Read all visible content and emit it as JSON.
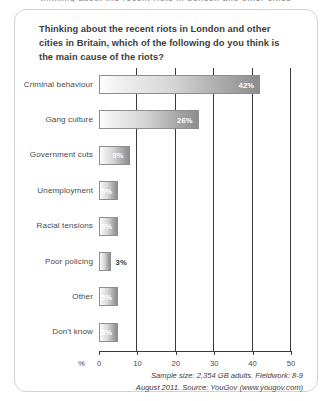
{
  "top_cropped_text": "thinking about the recent riots in London and other cities",
  "question": "Thinking about the recent riots in London and other cities in Britain, which of the following do you think is the main cause of the riots?",
  "axis": {
    "percent_sign": "%",
    "ticks": [
      "0",
      "10",
      "20",
      "30",
      "40",
      "50"
    ]
  },
  "footnote_line1": "Sample size: 2,354 GB adults. Fieldwork: 8-9",
  "footnote_line2": "August 2011. Source: YouGov (www.yougov.com)",
  "colors": {
    "bar_light": "#ffffff",
    "bar_dark": "#8d8d8d",
    "bar_border": "#8e8e8e",
    "grid": "#3a3a3a",
    "label": "#4a4a4a",
    "card_border": "#d3d3d3",
    "value_inside": "#ffffff",
    "value_outside": "#3a3a3a"
  },
  "chart_data": {
    "type": "bar",
    "orientation": "horizontal",
    "title": "Thinking about the recent riots in London and other cities in Britain, which of the following do you think is the main cause of the riots?",
    "xlabel": "%",
    "ylabel": "",
    "xlim": [
      0,
      50
    ],
    "xticks": [
      0,
      10,
      20,
      30,
      40,
      50
    ],
    "grid": true,
    "legend": "none",
    "categories": [
      "Criminal behaviour",
      "Gang culture",
      "Government cuts",
      "Unemployment",
      "Racial tensions",
      "Poor policing",
      "Other",
      "Don't know"
    ],
    "values": [
      42,
      26,
      8,
      5,
      5,
      3,
      5,
      5
    ],
    "data_labels": [
      "42%",
      "26%",
      "8%",
      "5%",
      "5%",
      "3%",
      "5%",
      "5%"
    ],
    "label_placement": [
      "inside",
      "inside",
      "inside",
      "inside",
      "inside",
      "outside",
      "inside",
      "inside"
    ],
    "annotations": [
      "Sample size: 2,354 GB adults. Fieldwork: 8-9 August 2011. Source: YouGov (www.yougov.com)"
    ]
  }
}
